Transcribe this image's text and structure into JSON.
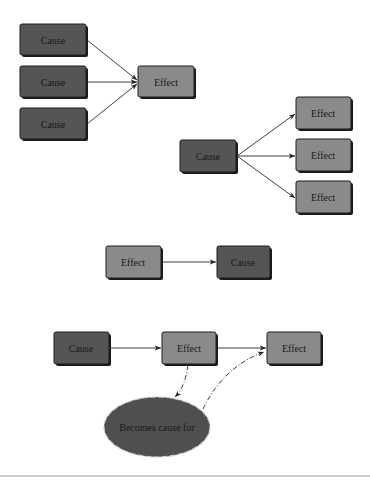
{
  "colors": {
    "cause": "#555555",
    "effect": "#8a8a8a",
    "outline": "#1e1e1e",
    "background": "#ffffff"
  },
  "diagram1": {
    "title": "Multiple causes, one effect",
    "causes": [
      "Cause",
      "Cause",
      "Cause"
    ],
    "effect": "Effect"
  },
  "diagram2": {
    "title": "One cause, multiple effects",
    "cause": "Cause",
    "effects": [
      "Effect",
      "Effect",
      "Effect"
    ]
  },
  "diagram3": {
    "title": "Effect leads to cause",
    "effect": "Effect",
    "cause": "Cause"
  },
  "diagram4": {
    "title": "Causal chain",
    "cause": "Cause",
    "effect1": "Effect",
    "effect2": "Effect",
    "ellipse": "Becomes cause for"
  }
}
